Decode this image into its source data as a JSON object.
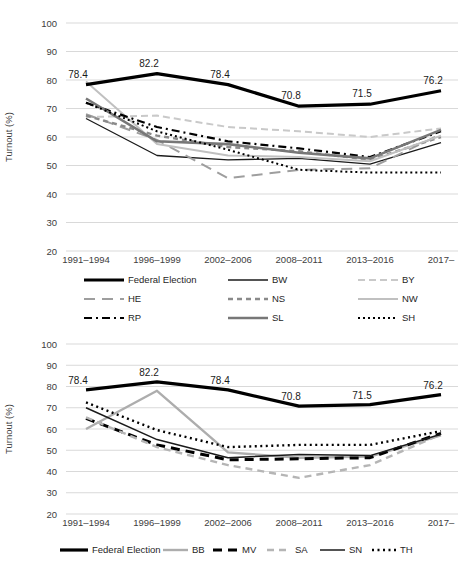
{
  "figure": {
    "background": "#ffffff",
    "grid_color": "#d9d9d9",
    "text_color": "#404040"
  },
  "chart_data": [
    {
      "id": "west-states-turnout",
      "type": "line",
      "ylabel": "Turnout (%)",
      "ylim": [
        20,
        100
      ],
      "grid": "horizontal",
      "yticks": [
        "100",
        "90",
        "80",
        "70",
        "60",
        "50",
        "40",
        "30",
        "20"
      ],
      "categories": [
        "1991–1994",
        "1996–1999",
        "2002–2006",
        "2008–2011",
        "2013–2016",
        "2017–"
      ],
      "annotated_series": "Federal Election",
      "annotations": [
        "78.4",
        "82.2",
        "78.4",
        "70.8",
        "71.5",
        "76.2"
      ],
      "series": [
        {
          "name": "BW",
          "values": [
            66.5,
            53.5,
            52,
            52.5,
            50.5,
            58
          ],
          "color": "#1a1a1a",
          "width": 1.3,
          "dash": ""
        },
        {
          "name": "BY",
          "values": [
            67,
            67.5,
            63.5,
            62,
            60,
            63
          ],
          "color": "#c9c9c9",
          "width": 2,
          "dash": "7 4"
        },
        {
          "name": "HE",
          "values": [
            68,
            59,
            45.5,
            48.5,
            49,
            61
          ],
          "color": "#9e9e9e",
          "width": 2,
          "dash": "11 7"
        },
        {
          "name": "NS",
          "values": [
            67.5,
            60.5,
            56.5,
            55,
            52,
            60
          ],
          "color": "#8a8a8a",
          "width": 2.4,
          "dash": "5 4"
        },
        {
          "name": "NW",
          "values": [
            79.5,
            57.5,
            53.5,
            53,
            51.5,
            60.5
          ],
          "color": "#c0c0c0",
          "width": 2,
          "dash": ""
        },
        {
          "name": "RP",
          "values": [
            72,
            63.5,
            58.5,
            56,
            53,
            62
          ],
          "color": "#000000",
          "width": 2.2,
          "dash": "8 4 2 4"
        },
        {
          "name": "SL",
          "values": [
            73.5,
            58.5,
            57.5,
            54.5,
            52.5,
            62.5
          ],
          "color": "#777777",
          "width": 2.6,
          "dash": ""
        },
        {
          "name": "SH",
          "values": [
            72,
            62,
            55.5,
            48.5,
            47.5,
            47.5
          ],
          "color": "#000000",
          "width": 2,
          "dash": "2 3"
        },
        {
          "name": "Federal Election",
          "values": [
            78.4,
            82.2,
            78.4,
            70.8,
            71.5,
            76.2
          ],
          "color": "#000000",
          "width": 3.2,
          "dash": ""
        }
      ],
      "legend_rows": [
        [
          "Federal Election",
          "BW",
          "BY"
        ],
        [
          "HE",
          "NS",
          "NW"
        ],
        [
          "RP",
          "SL",
          "SH"
        ]
      ]
    },
    {
      "id": "east-states-turnout",
      "type": "line",
      "ylabel": "Turnout (%)",
      "ylim": [
        20,
        100
      ],
      "grid": "horizontal",
      "yticks": [
        "100",
        "90",
        "80",
        "70",
        "60",
        "50",
        "40",
        "30",
        "20"
      ],
      "categories": [
        "1991–1994",
        "1996–1999",
        "2002–2006",
        "2008–2011",
        "2013–2016",
        "2017–"
      ],
      "annotated_series": "Federal Election",
      "annotations": [
        "78.4",
        "82.2",
        "78.4",
        "70.8",
        "71.5",
        "76.2"
      ],
      "series": [
        {
          "name": "BB",
          "values": [
            60,
            78,
            49,
            46.5,
            47,
            57
          ],
          "color": "#adadad",
          "width": 2.4,
          "dash": ""
        },
        {
          "name": "MV",
          "values": [
            65,
            52.5,
            45.5,
            46,
            46.5,
            58
          ],
          "color": "#000000",
          "width": 3,
          "dash": "9 6"
        },
        {
          "name": "SA",
          "values": [
            65.5,
            51.5,
            43,
            37,
            43,
            57.5
          ],
          "color": "#b5b5b5",
          "width": 2.4,
          "dash": "7 5"
        },
        {
          "name": "SN",
          "values": [
            70,
            55,
            46.5,
            48,
            47.5,
            57.5
          ],
          "color": "#1a1a1a",
          "width": 1.5,
          "dash": ""
        },
        {
          "name": "TH",
          "values": [
            72.5,
            59.5,
            51.5,
            52.5,
            52.5,
            59
          ],
          "color": "#000000",
          "width": 2.4,
          "dash": "2 3.5"
        },
        {
          "name": "Federal Election",
          "values": [
            78.4,
            82.2,
            78.4,
            70.8,
            71.5,
            76.2
          ],
          "color": "#000000",
          "width": 3.2,
          "dash": ""
        }
      ],
      "legend_rows": [
        [
          "Federal Election",
          "BB",
          "MV",
          "SA",
          "SN",
          "TH"
        ]
      ]
    }
  ]
}
